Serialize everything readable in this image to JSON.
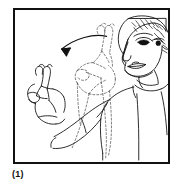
{
  "figure": {
    "caption": "(1)",
    "frame": {
      "border_color": "#111111",
      "background_color": "#ffffff",
      "border_width_px": 2
    },
    "ink_color": "#111111",
    "ghost_color": "#555555",
    "illustration": {
      "subject": "woman performing a two-finger hand sign moving to the left",
      "elements": [
        {
          "name": "head-profile",
          "description": "Woman's head in three-quarter profile facing left, upper right of frame",
          "style": "solid-line"
        },
        {
          "name": "hair",
          "description": "Short curly hair with scribbled texture strokes",
          "style": "solid-line"
        },
        {
          "name": "eye",
          "description": "Single visible eye with shaded iris",
          "style": "solid-line"
        },
        {
          "name": "nose",
          "description": "Profile nose line",
          "style": "solid-line"
        },
        {
          "name": "lips",
          "description": "Closed lips with outlined upper and lower lip",
          "style": "solid-line"
        },
        {
          "name": "neck-and-collar",
          "description": "Neck with rounded shirt collar",
          "style": "solid-line"
        },
        {
          "name": "torso",
          "description": "Shoulder and upper body of a shirt",
          "style": "solid-line"
        },
        {
          "name": "arm",
          "description": "Right arm bent at elbow reaching down and to the left",
          "style": "solid-line"
        },
        {
          "name": "hand-final-position",
          "description": "Hand at the left with index and middle fingers extended upward, thumb out",
          "style": "solid-line"
        },
        {
          "name": "hand-start-position-ghost",
          "description": "Dashed outline of the same hand and forearm at its starting position near the chest",
          "style": "dashed-line"
        },
        {
          "name": "motion-arrow",
          "description": "Curved arrow sweeping from the right to the left indicating the direction of hand movement",
          "style": "solid-line-with-arrowhead",
          "direction": "right-to-left"
        }
      ]
    }
  }
}
